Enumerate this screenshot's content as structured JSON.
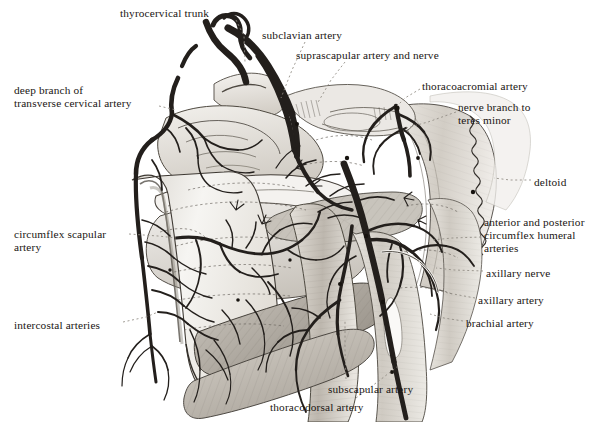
{
  "plate": {
    "title": "Arterial supply of the posterior scapular and shoulder region",
    "width": 614,
    "height": 422,
    "background": "#ffffff",
    "ink": "#1a1613",
    "leader_color": "#8f8a82",
    "wash_light": "#e8e5e0",
    "wash_mid": "#b8b3ab",
    "wash_dark": "#6e6a64",
    "vessel_fill": "#2b2724"
  },
  "labels": [
    {
      "id": "thyrocervical-trunk",
      "text": "thyrocervical trunk",
      "x": 120,
      "y": 7,
      "align": "left"
    },
    {
      "id": "subclavian-artery",
      "text": "subclavian artery",
      "x": 262,
      "y": 29,
      "align": "left"
    },
    {
      "id": "suprascapular-artery-and-nerve",
      "text": "suprascapular artery and nerve",
      "x": 296,
      "y": 49,
      "align": "left"
    },
    {
      "id": "deep-branch-transverse-cervical",
      "text": "deep branch of\ntransverse cervical artery",
      "x": 14,
      "y": 84,
      "align": "left"
    },
    {
      "id": "thoracoacromial-artery",
      "text": "thoracoacromial artery",
      "x": 422,
      "y": 80,
      "align": "left"
    },
    {
      "id": "nerve-branch-to-teres-minor",
      "text": "nerve branch to\nteres minor",
      "x": 458,
      "y": 101,
      "align": "left"
    },
    {
      "id": "deltoid",
      "text": "deltoid",
      "x": 534,
      "y": 176,
      "align": "left"
    },
    {
      "id": "circumflex-scapular-artery",
      "text": "circumflex scapular\nartery",
      "x": 14,
      "y": 228,
      "align": "left"
    },
    {
      "id": "circumflex-humeral-arteries",
      "text": "anterior and posterior\ncircumflex humeral\narteries",
      "x": 484,
      "y": 216,
      "align": "left"
    },
    {
      "id": "axillary-nerve",
      "text": "axillary nerve",
      "x": 486,
      "y": 267,
      "align": "left"
    },
    {
      "id": "axillary-artery",
      "text": "axillary artery",
      "x": 478,
      "y": 294,
      "align": "left"
    },
    {
      "id": "brachial-artery",
      "text": "brachial artery",
      "x": 466,
      "y": 317,
      "align": "left"
    },
    {
      "id": "intercostal-arteries",
      "text": "intercostal arteries",
      "x": 14,
      "y": 319,
      "align": "left"
    },
    {
      "id": "subscapular-artery",
      "text": "subscapular artery",
      "x": 328,
      "y": 383,
      "align": "left"
    },
    {
      "id": "thoracodorsal-artery",
      "text": "thoracodorsal artery",
      "x": 270,
      "y": 401,
      "align": "left"
    }
  ],
  "leaders": [
    {
      "id": "leader-thyrocervical-trunk",
      "d": "M 236 20 L 244 36 L 245 62"
    },
    {
      "id": "leader-subclavian-artery",
      "d": "M 305 42 L 292 70 L 281 98"
    },
    {
      "id": "leader-suprascapular",
      "d": "M 345 62 L 331 80 L 317 104"
    },
    {
      "id": "leader-deep-branch",
      "d": "M 159 106 L 176 110"
    },
    {
      "id": "leader-thoracoacromial",
      "d": "M 420 89 L 405 98 L 397 106"
    },
    {
      "id": "leader-nerve-teres-minor",
      "d": "M 456 112 L 428 122 L 406 128"
    },
    {
      "id": "leader-deltoid",
      "d": "M 531 180 L 510 180 L 494 178"
    },
    {
      "id": "leader-circumflex-scapular",
      "d": "M 129 234 L 158 236 L 176 238"
    },
    {
      "id": "leader-circumflex-humeral",
      "d": "M 481 237 L 452 238 L 432 240"
    },
    {
      "id": "leader-axillary-nerve",
      "d": "M 483 271 L 454 270 L 436 268"
    },
    {
      "id": "leader-axillary-artery",
      "d": "M 475 298 L 448 293 L 428 288"
    },
    {
      "id": "leader-brachial-artery",
      "d": "M 463 321 L 444 318 L 430 314"
    },
    {
      "id": "leader-intercostal-arteries",
      "d": "M 123 322 L 146 317 L 158 312"
    },
    {
      "id": "leader-subscapular-artery",
      "d": "M 346 379 L 345 350 L 345 320"
    },
    {
      "id": "leader-thoracodorsal-artery",
      "d": "M 356 398 L 380 380 L 398 366"
    }
  ]
}
